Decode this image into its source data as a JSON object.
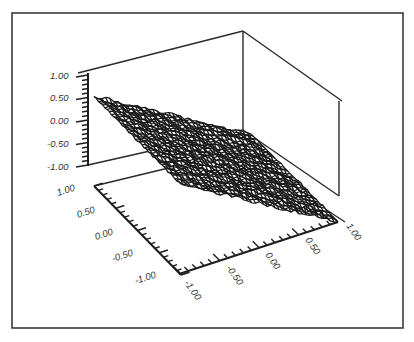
{
  "chart_data": {
    "type": "surface3d",
    "title": "",
    "xlabel": "",
    "ylabel": "",
    "zlabel": "",
    "x_axis": {
      "range": [
        -1.0,
        1.0
      ],
      "ticks": [
        "-1.00",
        "-0.50",
        "0.00",
        "0.50",
        "1.00"
      ]
    },
    "y_axis": {
      "range": [
        -1.0,
        1.0
      ],
      "ticks": [
        "-1.00",
        "-0.50",
        "0.00",
        "0.50",
        "1.00"
      ]
    },
    "z_axis": {
      "range": [
        -1.0,
        1.0
      ],
      "ticks": [
        "-1.00",
        "-0.50",
        "0.00",
        "0.50",
        "1.00"
      ]
    },
    "surface": {
      "model": "z = approximately -x (plane sloping from 1.00 at back to -1.00 at front along the right floor axis), with small random noise",
      "grid_resolution": 40,
      "corner_values": {
        "x=-1,y=-1": 1.0,
        "x=-1,y=1": 1.0,
        "x=1,y=-1": -1.0,
        "x=1,y=1": -1.0
      },
      "noise_amplitude": 0.04
    },
    "grid": false,
    "legend": null
  },
  "labels": {
    "z": [
      "1.00",
      "0.50",
      "0.00",
      "-0.50",
      "-1.00"
    ],
    "y_left": [
      "1.00",
      "0.50",
      "0.00",
      "-0.50",
      "-1.00"
    ],
    "x_right": [
      "-1.00",
      "-0.50",
      "0.00",
      "0.50",
      "1.00"
    ]
  },
  "colors": {
    "line": "#1a1a1a",
    "frame": "#3a3a3a",
    "background": "#ffffff"
  }
}
